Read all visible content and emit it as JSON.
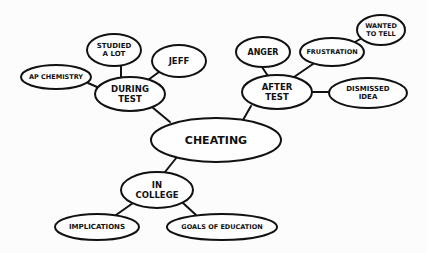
{
  "diagram": {
    "type": "mind-map",
    "central": "CHEATING",
    "nodes": {
      "cheating": {
        "lines": [
          "CHEATING"
        ],
        "cx": 216,
        "cy": 140,
        "rx": 65,
        "ry": 22,
        "fs": 11
      },
      "during_test": {
        "lines": [
          "DURING",
          "TEST"
        ],
        "cx": 130,
        "cy": 94,
        "rx": 35,
        "ry": 17,
        "fs": 8.5
      },
      "after_test": {
        "lines": [
          "AFTER",
          "TEST"
        ],
        "cx": 277,
        "cy": 92,
        "rx": 35,
        "ry": 17,
        "fs": 8.5
      },
      "in_college": {
        "lines": [
          "IN",
          "COLLEGE"
        ],
        "cx": 157,
        "cy": 190,
        "rx": 36,
        "ry": 18,
        "fs": 8.5
      },
      "ap_chemistry": {
        "lines": [
          "AP CHEMISTRY"
        ],
        "cx": 56,
        "cy": 77,
        "rx": 35,
        "ry": 12,
        "fs": 6.5
      },
      "studied_a_lot": {
        "lines": [
          "STUDIED",
          "A LOT"
        ],
        "cx": 114,
        "cy": 50,
        "rx": 27,
        "ry": 16,
        "fs": 7
      },
      "jeff": {
        "lines": [
          "JEFF"
        ],
        "cx": 179,
        "cy": 61,
        "rx": 27,
        "ry": 16,
        "fs": 8.5
      },
      "anger": {
        "lines": [
          "ANGER"
        ],
        "cx": 263,
        "cy": 52,
        "rx": 27,
        "ry": 15,
        "fs": 8
      },
      "frustration": {
        "lines": [
          "FRUSTRATION"
        ],
        "cx": 332,
        "cy": 52,
        "rx": 32,
        "ry": 14,
        "fs": 6.5
      },
      "wanted_to_tell": {
        "lines": [
          "WANTED",
          "TO TELL"
        ],
        "cx": 381,
        "cy": 30,
        "rx": 24,
        "ry": 15,
        "fs": 6.5
      },
      "dismissed_idea": {
        "lines": [
          "DISMISSED",
          "IDEA"
        ],
        "cx": 368,
        "cy": 93,
        "rx": 39,
        "ry": 15,
        "fs": 7
      },
      "implications": {
        "lines": [
          "IMPLICATIONS"
        ],
        "cx": 97,
        "cy": 227,
        "rx": 42,
        "ry": 13,
        "fs": 7
      },
      "goals_of_education": {
        "lines": [
          "GOALS OF EDUCATION"
        ],
        "cx": 222,
        "cy": 227,
        "rx": 55,
        "ry": 13,
        "fs": 6.5
      }
    },
    "edges": [
      {
        "from": "cheating",
        "to": "during_test",
        "x1": 170,
        "y1": 122,
        "x2": 152,
        "y2": 107
      },
      {
        "from": "cheating",
        "to": "after_test",
        "x1": 243,
        "y1": 120,
        "x2": 251,
        "y2": 106
      },
      {
        "from": "cheating",
        "to": "in_college",
        "x1": 177,
        "y1": 157,
        "x2": 165,
        "y2": 172
      },
      {
        "from": "during_test",
        "to": "ap_chemistry",
        "x1": 97,
        "y1": 87,
        "x2": 88,
        "y2": 83
      },
      {
        "from": "during_test",
        "to": "studied_a_lot",
        "x1": 121,
        "y1": 78,
        "x2": 121,
        "y2": 66
      },
      {
        "from": "during_test",
        "to": "jeff",
        "x1": 148,
        "y1": 80,
        "x2": 159,
        "y2": 72
      },
      {
        "from": "after_test",
        "to": "anger",
        "x1": 268,
        "y1": 76,
        "x2": 262,
        "y2": 67
      },
      {
        "from": "after_test",
        "to": "frustration",
        "x1": 294,
        "y1": 77,
        "x2": 313,
        "y2": 64
      },
      {
        "from": "after_test",
        "to": "dismissed_idea",
        "x1": 312,
        "y1": 92,
        "x2": 329,
        "y2": 92
      },
      {
        "from": "frustration",
        "to": "wanted_to_tell",
        "x1": 355,
        "y1": 42,
        "x2": 362,
        "y2": 38
      },
      {
        "from": "in_college",
        "to": "implications",
        "x1": 133,
        "y1": 203,
        "x2": 116,
        "y2": 215
      },
      {
        "from": "in_college",
        "to": "goals_of_education",
        "x1": 183,
        "y1": 203,
        "x2": 196,
        "y2": 215
      }
    ]
  }
}
